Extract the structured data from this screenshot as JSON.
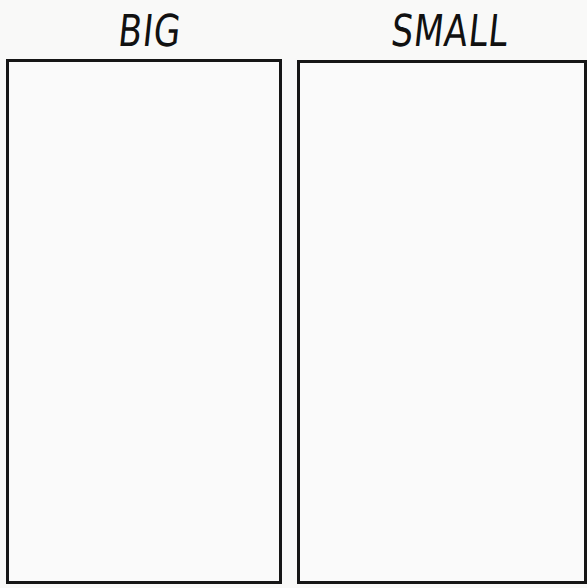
{
  "worksheet": {
    "columns": [
      {
        "heading": "BIG"
      },
      {
        "heading": "SMALL"
      }
    ]
  }
}
